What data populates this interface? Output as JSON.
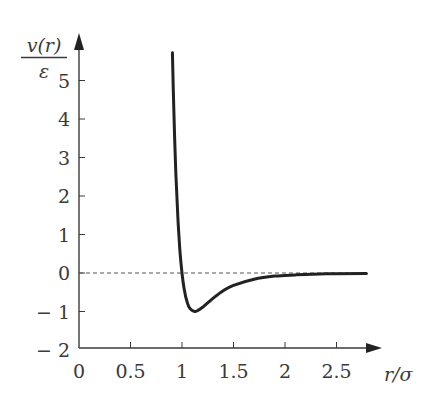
{
  "chart_data": {
    "type": "line",
    "title": "",
    "xlabel": "r/σ",
    "ylabel": {
      "numerator": "v(r)",
      "denominator": "ε"
    },
    "xlim": [
      0,
      2.8
    ],
    "ylim": [
      -2,
      6
    ],
    "grid": false,
    "legend": null,
    "x_ticks": [
      0,
      0.5,
      1,
      1.5,
      2,
      2.5
    ],
    "x_tick_labels": [
      "0",
      "0.5",
      "1",
      "1.5",
      "2",
      "2.5"
    ],
    "y_ticks": [
      -2,
      -1,
      0,
      1,
      2,
      3,
      4,
      5
    ],
    "y_tick_labels": [
      "− 2",
      "− 1",
      "0",
      "1",
      "2",
      "3",
      "4",
      "5"
    ],
    "reference_line": {
      "y": 0,
      "style": "dashed"
    },
    "series": [
      {
        "name": "Lennard-Jones potential v(r)/ε",
        "x": [
          0.907,
          0.92,
          0.94,
          0.96,
          0.98,
          1.0,
          1.02,
          1.05,
          1.08,
          1.1225,
          1.15,
          1.2,
          1.3,
          1.4,
          1.5,
          1.7,
          1.9,
          2.1,
          2.4,
          2.79
        ],
        "y": [
          5.72,
          4.28,
          2.61,
          1.42,
          0.58,
          0.0,
          -0.4,
          -0.76,
          -0.93,
          -1.0,
          -0.98,
          -0.89,
          -0.66,
          -0.46,
          -0.32,
          -0.16,
          -0.08,
          -0.05,
          -0.02,
          -0.01
        ]
      }
    ]
  },
  "colors": {
    "curve": "#222222",
    "axis": "#3a3a3a",
    "dashed": "#555555"
  }
}
